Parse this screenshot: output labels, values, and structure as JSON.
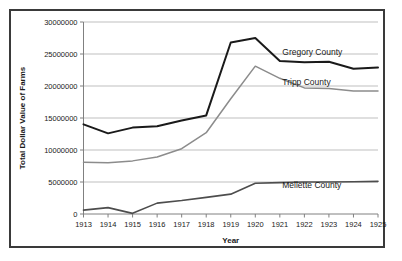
{
  "figure": {
    "background_color": "#ffffff",
    "border_color": "#3a3a3a"
  },
  "chart_data": {
    "type": "line",
    "title": "",
    "xlabel": "Year",
    "ylabel": "Total Dollar  Value of Farms",
    "categories": [
      "1913",
      "1914",
      "1915",
      "1916",
      "1917",
      "1918",
      "1919",
      "1920",
      "1921",
      "1922",
      "1923",
      "1924",
      "1925"
    ],
    "x": [
      1913,
      1914,
      1915,
      1916,
      1917,
      1918,
      1919,
      1920,
      1921,
      1922,
      1923,
      1924,
      1925
    ],
    "ylim": [
      0,
      30000000
    ],
    "xlim": [
      1913,
      1925
    ],
    "ytick_labels": [
      "0",
      "5000000",
      "10000000",
      "15000000",
      "20000000",
      "25000000",
      "30000000"
    ],
    "ytick_values": [
      0,
      5000000,
      10000000,
      15000000,
      20000000,
      25000000,
      30000000
    ],
    "grid": "horizontal",
    "legend_position": "inline-right-labels",
    "series": [
      {
        "name": "Gregory County",
        "color": "#1a1a1a",
        "line_width": 2.0,
        "label_position": "right",
        "values": [
          14000000,
          12600000,
          13500000,
          13700000,
          14600000,
          15400000,
          26800000,
          27500000,
          23900000,
          23700000,
          23800000,
          22700000,
          22900000
        ]
      },
      {
        "name": "Tripp County",
        "color": "#8c8c8c",
        "line_width": 1.5,
        "label_position": "right",
        "values": [
          8100000,
          8000000,
          8300000,
          8900000,
          10200000,
          12700000,
          18000000,
          23100000,
          21200000,
          19700000,
          19600000,
          19200000,
          19200000
        ]
      },
      {
        "name": "Mellette County",
        "color": "#4d4d4d",
        "line_width": 1.6,
        "label_position": "right",
        "values": [
          600000,
          1000000,
          100000,
          1700000,
          2100000,
          2600000,
          3100000,
          4800000,
          4900000,
          5000000,
          5000000,
          5050000,
          5100000
        ]
      }
    ],
    "annotations": [
      {
        "text": "Gregory County",
        "x": 1921.1,
        "y": 24900000
      },
      {
        "text": "Tripp County",
        "x": 1921.1,
        "y": 20100000
      },
      {
        "text": "Mellette County",
        "x": 1921.1,
        "y": 4000000
      }
    ]
  }
}
